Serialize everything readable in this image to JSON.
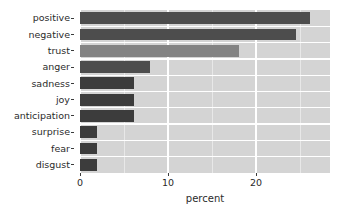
{
  "chart_data": {
    "type": "bar",
    "orientation": "horizontal",
    "title": "",
    "subtitle": "",
    "xlabel": "percent",
    "ylabel": "",
    "categories": [
      "positive",
      "negative",
      "trust",
      "anger",
      "sadness",
      "joy",
      "anticipation",
      "surprise",
      "fear",
      "disgust"
    ],
    "values": [
      26.1,
      24.5,
      18.1,
      8.0,
      6.1,
      6.1,
      6.1,
      1.9,
      1.9,
      1.9
    ],
    "bar_colors": [
      "#4d4d4d",
      "#4d4d4d",
      "#838383",
      "#4d4d4d",
      "#3c3c3c",
      "#3c3c3c",
      "#3c3c3c",
      "#3c3c3c",
      "#3c3c3c",
      "#3c3c3c"
    ],
    "xlim": [
      0,
      28.4
    ],
    "x_ticks": [
      0,
      10,
      20
    ],
    "x_tick_labels": [
      "0",
      "10",
      "20"
    ],
    "x_minor_ticks": [
      5,
      15,
      25
    ],
    "grid": true,
    "grid_color": "#ffffff",
    "minor_grid_color": "#e8e8e8",
    "panel_background": "#d4d4d4",
    "plot_background": "#ffffff",
    "legend": "none",
    "legend_position": "none"
  },
  "axis": {
    "x_title": "percent"
  }
}
